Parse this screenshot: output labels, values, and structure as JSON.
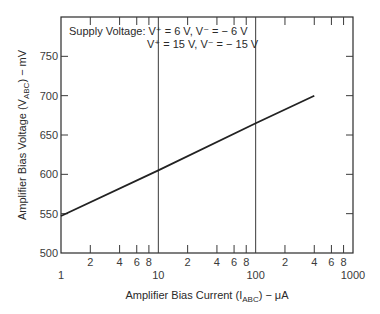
{
  "chart_data": {
    "type": "line",
    "title": "",
    "xlabel": "Amplifier Bias Current (I_ABC) − μA",
    "xlabel_parts": {
      "main": "Amplifier Bias Current (I",
      "sub": "ABC",
      "tail": ") − μA"
    },
    "ylabel": "Amplifier Bias Voltage (V_ABC) − mV",
    "ylabel_parts": {
      "main": "Amplifier Bias Voltage (V",
      "sub": "ABC",
      "tail": ") − mV"
    },
    "x_scale": "log",
    "xlim": [
      1,
      1000
    ],
    "ylim": [
      500,
      800
    ],
    "grid": "vertical lines at decades 10 and 100",
    "x_major_ticks": [
      {
        "value": 1,
        "label": "1"
      },
      {
        "value": 10,
        "label": "10"
      },
      {
        "value": 100,
        "label": "100"
      },
      {
        "value": 1000,
        "label": "1000"
      }
    ],
    "x_minor_ticks": [
      {
        "value": 2,
        "label": "2"
      },
      {
        "value": 4,
        "label": "4"
      },
      {
        "value": 6,
        "label": "6"
      },
      {
        "value": 8,
        "label": "8"
      },
      {
        "value": 20,
        "label": "2"
      },
      {
        "value": 40,
        "label": "4"
      },
      {
        "value": 60,
        "label": "6"
      },
      {
        "value": 80,
        "label": "8"
      },
      {
        "value": 200,
        "label": "2"
      },
      {
        "value": 400,
        "label": "4"
      },
      {
        "value": 600,
        "label": "6"
      },
      {
        "value": 800,
        "label": "8"
      }
    ],
    "y_ticks": [
      {
        "value": 500,
        "label": "500"
      },
      {
        "value": 550,
        "label": "550"
      },
      {
        "value": 600,
        "label": "600"
      },
      {
        "value": 650,
        "label": "650"
      },
      {
        "value": 700,
        "label": "700"
      },
      {
        "value": 750,
        "label": "750"
      }
    ],
    "annotation": {
      "line1": "Supply Voltage: V⁺ = 6 V, V⁻ = − 6 V",
      "line2": "V⁺ = 15 V, V⁻ = − 15 V"
    },
    "series": [
      {
        "name": "V_ABC vs I_ABC",
        "x": [
          1,
          10,
          100,
          400
        ],
        "y": [
          547,
          605,
          665,
          700
        ]
      }
    ]
  }
}
